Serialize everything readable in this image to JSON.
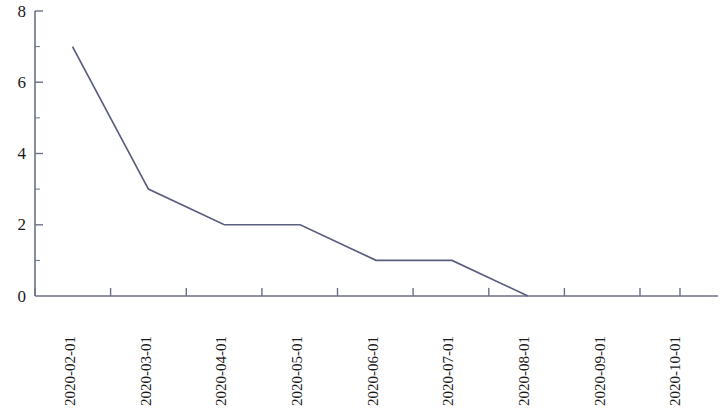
{
  "chart_data": {
    "type": "line",
    "title": "",
    "xlabel": "",
    "ylabel": "",
    "categories": [
      "2020-02-01",
      "2020-03-01",
      "2020-04-01",
      "2020-05-01",
      "2020-06-01",
      "2020-07-01",
      "2020-08-01",
      "2020-09-01",
      "2020-10-01"
    ],
    "values": [
      7,
      3,
      2,
      2,
      1,
      1,
      0,
      null,
      null
    ],
    "series": [
      {
        "name": "series-1",
        "values": [
          7,
          3,
          2,
          2,
          1,
          1,
          0,
          null,
          null
        ]
      }
    ],
    "ylim": [
      0,
      8
    ],
    "yticks": [
      0,
      2,
      4,
      6,
      8
    ],
    "ytick_labels": [
      "0",
      "2",
      "4",
      "6",
      "8"
    ],
    "y_minor_ticks": [
      1,
      3,
      5,
      7
    ],
    "grid": false,
    "legend": false,
    "legend_position": "none",
    "line_color": "#5b5f7f",
    "axis_color": "#6b7088",
    "text_color": "#1a1a1a",
    "background_color": "#ffffff"
  }
}
